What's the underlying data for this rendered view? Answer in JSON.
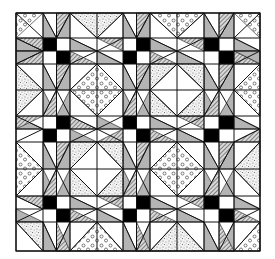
{
  "figure": {
    "title": "",
    "colors": {
      "background": "#ffffff",
      "line": "#111111",
      "black": "#000000",
      "gray": "#b4b4b4",
      "hatch": "#555555",
      "stipple": "#777777",
      "circle": "#444444"
    },
    "bounds": {
      "x0": 16,
      "y0": 13,
      "x1": 260,
      "y1": 251
    },
    "grid_x": [
      16,
      43,
      56.5,
      70,
      97,
      123,
      136.5,
      150,
      177,
      204,
      219,
      234,
      260
    ],
    "grid_y": [
      13,
      38,
      51,
      64,
      90,
      116,
      129,
      142,
      169,
      196,
      209,
      222,
      251
    ],
    "fills": {
      "black_squares": [
        [
          43,
          38,
          56.5,
          51
        ],
        [
          56.5,
          51,
          70,
          64
        ],
        [
          123,
          51,
          136.5,
          64
        ],
        [
          136.5,
          38,
          150,
          51
        ],
        [
          204,
          38,
          219,
          51
        ],
        [
          219,
          51,
          234,
          64
        ],
        [
          56.5,
          116,
          70,
          129
        ],
        [
          43,
          129,
          56.5,
          142
        ],
        [
          123,
          116,
          136.5,
          129
        ],
        [
          136.5,
          129,
          150,
          142
        ],
        [
          219,
          116,
          234,
          129
        ],
        [
          204,
          129,
          219,
          142
        ],
        [
          43,
          196,
          56.5,
          209
        ],
        [
          56.5,
          209,
          70,
          222
        ],
        [
          136.5,
          196,
          150,
          209
        ],
        [
          123,
          209,
          136.5,
          222
        ],
        [
          204,
          196,
          219,
          209
        ],
        [
          219,
          209,
          234,
          222
        ]
      ],
      "gray_polys": [
        "43,13 56.5,38 43,38",
        "56.5,38 70,13 70,38",
        "16,38 43,51 16,51",
        "16,51 43,51 16,64",
        "70,38 97,51 70,51",
        "97,51 123,64 97,64",
        "123,13 136.5,38 123,38",
        "150,13 150,38 136.5,38",
        "150,38 177,51 150,51",
        "177,51 204,64 177,64",
        "204,13 219,38 204,38",
        "234,13 234,38 219,38",
        "234,38 260,51 234,51",
        "234,51 260,64 260,51",
        "43,64 56.5,90 43,90",
        "70,64 70,90 56.5,90",
        "123,64 136.5,90 123,90",
        "150,64 150,90 136.5,90",
        "204,64 219,90 204,90",
        "234,64 234,90 219,90",
        "43,90 56.5,116 43,116",
        "56.5,116 70,90 70,116",
        "123,90 136.5,116 123,116",
        "136.5,116 150,90 150,116",
        "204,90 219,116 204,116",
        "219,116 234,90 234,116",
        "16,116 43,129 16,129",
        "70,129 97,142 70,142",
        "97,116 123,129 97,129",
        "150,116 177,129 150,129",
        "177,129 204,142 177,142",
        "234,116 260,129 234,129",
        "43,142 56.5,169 43,169",
        "70,142 70,169 56.5,169",
        "123,142 136.5,169 123,169",
        "150,142 150,169 136.5,169",
        "204,142 219,169 204,169",
        "234,142 234,169 219,169",
        "43,169 56.5,196 43,196",
        "56.5,196 70,169 70,196",
        "123,169 136.5,196 123,196",
        "136.5,196 150,169 150,196",
        "204,169 219,196 204,196",
        "219,196 234,169 234,196",
        "16,209 43,222 16,222",
        "70,196 97,209 70,209",
        "97,209 123,222 97,222",
        "150,196 177,209 150,209",
        "177,209 204,222 177,222",
        "234,196 260,209 234,209",
        "43,222 56.5,251 43,251",
        "70,222 70,251 56.5,251",
        "123,222 136.5,251 123,251",
        "150,222 150,251 136.5,251",
        "204,222 219,251 204,251",
        "234,222 234,251 219,251"
      ],
      "hatch_polys": [
        "56.5,13 70,13 56.5,38",
        "16,38 43,38 43,51",
        "97,38 123,38 123,51",
        "70,51 97,64 70,64",
        "136.5,13 150,13 136.5,38",
        "177,38 204,38 204,51",
        "150,51 177,64 150,64",
        "219,13 234,13 219,38",
        "234,51 260,64 234,64",
        "16,64 43,64 43,51",
        "56.5,64 70,64 56.5,90",
        "136.5,64 150,64 136.5,90",
        "219,64 234,64 219,90",
        "43,116 56.5,116 56.5,90",
        "123,116 136.5,116 136.5,90",
        "204,116 219,116 219,90",
        "43,116 16,116 16,129",
        "70,116 97,129 70,129",
        "123,129 97,142 123,142",
        "150,129 177,142 150,142",
        "204,116 177,116 204,129",
        "260,129 234,142 260,142",
        "56.5,142 70,142 56.5,169",
        "136.5,142 150,142 136.5,169",
        "219,142 234,142 219,169",
        "43,196 56.5,196 56.5,169",
        "123,196 136.5,196 136.5,169",
        "204,196 219,196 219,169",
        "16,196 43,196 43,209",
        "97,196 123,196 123,209",
        "70,209 97,222 70,222",
        "150,209 177,222 150,222",
        "204,196 177,196 204,209",
        "234,209 260,222 234,222",
        "56.5,222 70,251 56.5,251",
        "136.5,222 150,251 136.5,251",
        "219,222 234,251 219,251"
      ],
      "stipple_polys": [
        "70,13 97,38 123,13",
        "16,64 43,90 16,116",
        "150,64 177,64 150,90",
        "204,64 177,64 204,90",
        "150,116 177,116 150,90",
        "204,116 177,116 204,90",
        "70,142 97,142 70,169",
        "123,142 97,142 123,169",
        "70,196 97,196 70,169",
        "123,196 97,196 123,169",
        "260,142 234,169 260,196",
        "150,251 177,222 204,251",
        "16,222 43,251 43,222"
      ],
      "circle_polys": [
        "16,13 43,13 16,38",
        "150,13 177,38 204,13",
        "97,64 123,90 97,116 70,90",
        "260,64 234,90 260,116",
        "16,142 43,169 16,196",
        "177,142 204,169 177,196 150,169",
        "70,251 97,222 123,251",
        "260,222 234,251 260,251",
        "234,13 260,13 260,38"
      ],
      "white_diamonds": [
        "177,64 204,90 177,116 150,90",
        "97,142 123,169 97,196 70,169"
      ]
    },
    "lines": [
      "43,13 56.5,38",
      "70,13 56.5,38",
      "123,13 136.5,38",
      "150,13 136.5,38",
      "204,13 219,38",
      "234,13 219,38",
      "16,13 43,38",
      "70,13 97,38",
      "123,13 97,38",
      "150,13 177,38",
      "204,13 177,38",
      "260,13 234,38",
      "16,38 43,51",
      "16,64 43,51",
      "70,38 97,51",
      "123,38 97,51",
      "70,64 97,51",
      "123,64 97,51",
      "150,38 177,51",
      "204,38 177,51",
      "150,64 177,51",
      "204,64 177,51",
      "234,38 260,51",
      "234,64 260,51",
      "43,64 56.5,90",
      "70,64 56.5,90",
      "123,64 136.5,90",
      "150,64 136.5,90",
      "204,64 219,90",
      "234,64 219,90",
      "43,116 56.5,90",
      "70,116 56.5,90",
      "123,116 136.5,90",
      "150,116 136.5,90",
      "204,116 219,90",
      "234,116 219,90",
      "16,64 43,90",
      "16,116 43,90",
      "97,64 70,90",
      "97,64 123,90",
      "97,116 70,90",
      "97,116 123,90",
      "177,64 150,90",
      "177,64 204,90",
      "177,116 150,90",
      "177,116 204,90",
      "260,64 234,90",
      "260,116 234,90",
      "16,116 43,129",
      "16,142 43,129",
      "70,116 97,129",
      "123,116 97,129",
      "70,142 97,129",
      "123,142 97,129",
      "150,116 177,129",
      "204,116 177,129",
      "150,142 177,129",
      "204,142 177,129",
      "234,116 260,129",
      "234,142 260,129",
      "43,142 56.5,169",
      "70,142 56.5,169",
      "123,142 136.5,169",
      "150,142 136.5,169",
      "204,142 219,169",
      "234,142 219,169",
      "43,196 56.5,169",
      "70,196 56.5,169",
      "123,196 136.5,169",
      "150,196 136.5,169",
      "204,196 219,169",
      "234,196 219,169",
      "16,142 43,169",
      "16,196 43,169",
      "97,142 70,169",
      "97,142 123,169",
      "97,196 70,169",
      "97,196 123,169",
      "177,142 150,169",
      "177,142 204,169",
      "177,196 150,169",
      "177,196 204,169",
      "260,142 234,169",
      "260,196 234,169",
      "16,196 43,209",
      "16,222 43,209",
      "70,196 97,209",
      "123,196 97,209",
      "70,222 97,209",
      "123,222 97,209",
      "150,196 177,209",
      "204,196 177,209",
      "150,222 177,209",
      "204,222 177,209",
      "234,196 260,209",
      "234,222 260,209",
      "43,222 56.5,251",
      "70,222 56.5,251",
      "123,222 136.5,251",
      "150,222 136.5,251",
      "204,222 219,251",
      "234,222 219,251",
      "16,222 43,251",
      "70,251 97,222",
      "123,251 97,222",
      "150,251 177,222",
      "204,251 177,222",
      "260,222 234,251"
    ]
  }
}
